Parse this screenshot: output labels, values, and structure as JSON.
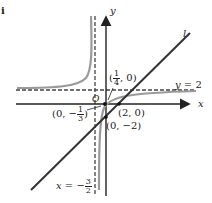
{
  "figure": {
    "corner_label": "i",
    "axes": {
      "x_label": "x",
      "y_label": "y",
      "origin_label": "O"
    },
    "asymptotes": {
      "horizontal": {
        "label": "y = 2",
        "lhs": "y",
        "rhs": "2"
      },
      "vertical": {
        "label": "x = -3/2",
        "lhs": "x",
        "sign": "−",
        "num": "3",
        "den": "2"
      }
    },
    "line_label": "l",
    "points": {
      "p1": {
        "label": "(1/4, 0)",
        "open": "(",
        "num": "1",
        "den": "4",
        "close": ", 0)"
      },
      "p2": {
        "label": "(2, 0)"
      },
      "p3": {
        "label": "(0, -2)",
        "text": "(0, −2)"
      },
      "p4": {
        "label": "(0, -1/3)",
        "open": "(0, −",
        "num": "1",
        "den": "3",
        "close": ")"
      }
    },
    "colors": {
      "axis": "#222222",
      "line": "#333333",
      "curve": "#9a9a9a",
      "dash": "#444444"
    }
  }
}
